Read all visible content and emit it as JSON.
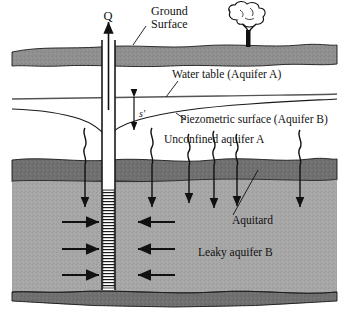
{
  "figure": {
    "type": "hydrogeology-cross-section",
    "width": 350,
    "height": 319
  },
  "labels": {
    "discharge": "Q",
    "ground_surface_line1": "Ground",
    "ground_surface_line2": "Surface",
    "water_table": "Water table (Aquifer A)",
    "piezometric_surface": "Piezometric surface (Aquifer B)",
    "unconfined_aquifer": "Unconfined aquifer A",
    "drawdown": "s′",
    "aquitard": "Aquitard",
    "leaky_aquifer": "Leaky aquifer B"
  },
  "colors": {
    "background": "#ffffff",
    "topsoil": "#8f8f8f",
    "unconfined_aquifer": "#ffffff",
    "aquitard": "#6f6f6f",
    "leaky_aquifer": "#a6a6a6",
    "bedrock": "#6f6f6f",
    "line": "#1a1a1a",
    "well_casing": "#ffffff",
    "well_screen": "#ffffff",
    "text": "#111111"
  },
  "geometry": {
    "well_center_x": 108,
    "well_outer_left": 101,
    "well_outer_right": 116,
    "screen_top_y": 190,
    "screen_bottom_y": 288,
    "ground_surface_y": 46,
    "topsoil_bottom_y": 64,
    "aquitard_top_y": 160,
    "aquitard_bottom_y": 182,
    "bedrock_top_y": 289
  },
  "features": {
    "leakage_arrow_count": 6,
    "horizontal_flow_arrow_pairs": 3,
    "tree_present": true,
    "discharge_arrow_direction": "up",
    "drawdown_arrow_direction": "double-vertical",
    "cone_of_depression": true
  }
}
